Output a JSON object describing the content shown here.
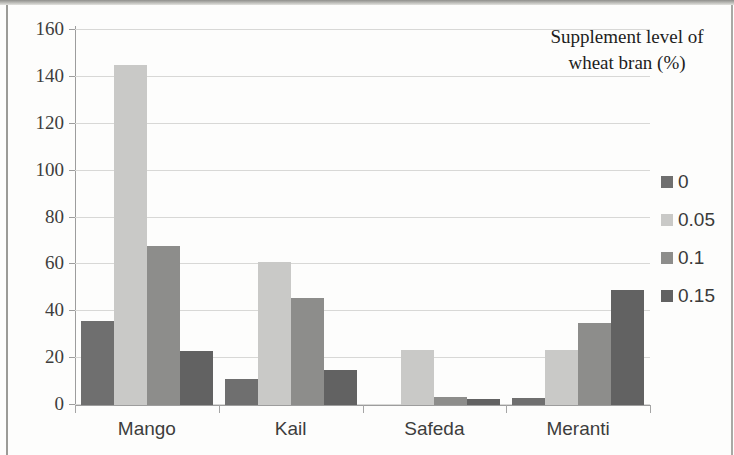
{
  "chart_data": {
    "type": "bar",
    "title": "",
    "xlabel": "",
    "ylabel": "",
    "ylim": [
      0,
      160
    ],
    "ytick_step": 20,
    "yticks": [
      0,
      20,
      40,
      60,
      80,
      100,
      120,
      140,
      160
    ],
    "grid": true,
    "legend_position": "right",
    "legend_title": "Supplement level of wheat bran (%)",
    "legend_title_line1": "Supplement level of",
    "legend_title_line2": "wheat bran (%)",
    "categories": [
      "Mango",
      "Kail",
      "Safeda",
      "Meranti"
    ],
    "series": [
      {
        "name": "0",
        "color": "#6f6f6f",
        "values": [
          36,
          11,
          0,
          3
        ]
      },
      {
        "name": "0.05",
        "color": "#c9c9c7",
        "values": [
          145,
          61,
          23.5,
          23.5
        ]
      },
      {
        "name": "0.1",
        "color": "#8d8d8b",
        "values": [
          68,
          45.5,
          3.5,
          35
        ]
      },
      {
        "name": "0.15",
        "color": "#626262",
        "values": [
          23,
          15,
          2.5,
          49
        ]
      }
    ]
  }
}
